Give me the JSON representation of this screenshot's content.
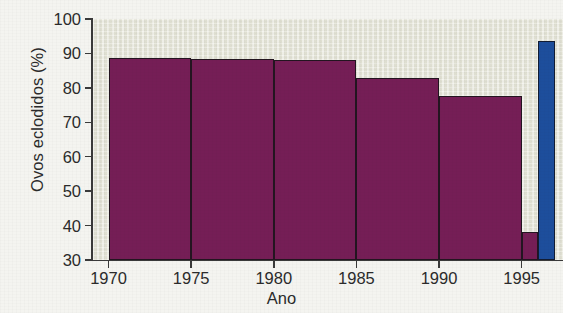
{
  "chart_data": {
    "type": "bar",
    "title": "",
    "subtitle": "",
    "xlabel": "Ano",
    "ylabel": "Ovos eclodidos (%)",
    "xlim": [
      1969,
      1997.5
    ],
    "ylim": [
      30,
      100
    ],
    "grid": false,
    "legend": null,
    "annotations": [],
    "xtick_labels": [
      "1970",
      "1975",
      "1980",
      "1985",
      "1990",
      "1995"
    ],
    "xticks": [
      1970,
      1975,
      1980,
      1985,
      1990,
      1995
    ],
    "ytick_labels": [
      "30",
      "40",
      "50",
      "60",
      "70",
      "80",
      "90",
      "100"
    ],
    "yticks": [
      30,
      40,
      50,
      60,
      70,
      80,
      90,
      100
    ],
    "colors": {
      "purple_bar": "#751e56",
      "blue_bar": "#1d4e9c",
      "plot_background": "#e4e4d6",
      "page_background": "#f4f4f0",
      "axis": "#3a3a3a",
      "bar_outline": "#231520"
    },
    "bars": [
      {
        "label": "1970",
        "x_start": 1970,
        "x_end": 1975,
        "value": 88.8,
        "color": "#751e56"
      },
      {
        "label": "1975",
        "x_start": 1975,
        "x_end": 1980,
        "value": 88.5,
        "color": "#751e56"
      },
      {
        "label": "1980",
        "x_start": 1980,
        "x_end": 1985,
        "value": 88.0,
        "color": "#751e56"
      },
      {
        "label": "1985",
        "x_start": 1985,
        "x_end": 1990,
        "value": 83.0,
        "color": "#751e56"
      },
      {
        "label": "1990",
        "x_start": 1990,
        "x_end": 1995,
        "value": 77.5,
        "color": "#751e56"
      },
      {
        "label": "1990b",
        "x_start": 1995,
        "x_end": 1996,
        "value": 38.0,
        "color": "#751e56"
      },
      {
        "label": "1995",
        "x_start": 1996,
        "x_end": 1997,
        "value": 93.5,
        "color": "#1d4e9c"
      }
    ]
  }
}
